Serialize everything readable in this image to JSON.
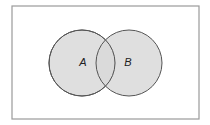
{
  "diagram": {
    "type": "venn",
    "universe": {
      "x": 12,
      "y": 6,
      "width": 187,
      "height": 113,
      "stroke": "#9a9a9a",
      "fill": "#ffffff"
    },
    "sets": [
      {
        "label": "A",
        "cx": 82,
        "cy": 63,
        "r": 33,
        "label_x": 83,
        "label_y": 66
      },
      {
        "label": "B",
        "cx": 129,
        "cy": 63,
        "r": 33,
        "label_x": 128,
        "label_y": 66
      }
    ],
    "colors": {
      "circle_fill": "#d9d9d9",
      "circle_stroke": "#555555",
      "label": "#222222"
    }
  }
}
